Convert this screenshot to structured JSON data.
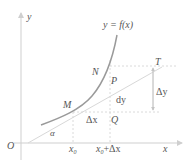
{
  "diagram": {
    "colors": {
      "axis": "#cfcfcf",
      "curve": "#9a9a9a",
      "tangent": "#d8d8d8",
      "dashed": "#d0d0d0",
      "label": "#555555"
    },
    "axes": {
      "x_label": "x",
      "y_label": "y",
      "origin_label": "O"
    },
    "curve_label": "y = f(x)",
    "points": {
      "M": "M",
      "N": "N",
      "P": "P",
      "Q": "Q",
      "T": "T"
    },
    "angle_label": "α",
    "x_ticks": {
      "x0": "x",
      "x0_sub": "0",
      "x0dx": "x",
      "x0dx_sub": "0",
      "x0dx_suffix": "+Δx"
    },
    "increments": {
      "dx": "Δx",
      "dy": "dy",
      "delta_y": "Δy"
    }
  }
}
